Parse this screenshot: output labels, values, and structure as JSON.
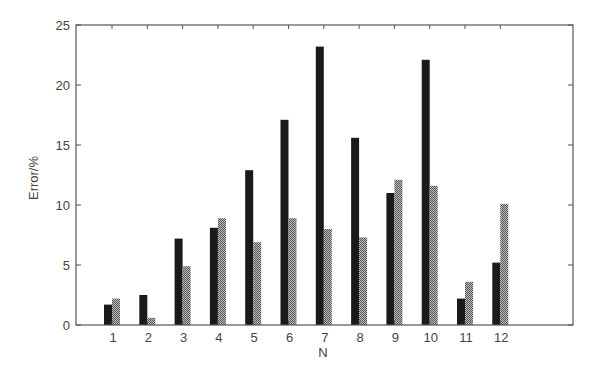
{
  "chart_data": {
    "type": "bar",
    "title": "",
    "xlabel": "N",
    "ylabel": "Error/%",
    "categories": [
      "1",
      "2",
      "3",
      "4",
      "5",
      "6",
      "7",
      "8",
      "9",
      "10",
      "11",
      "12"
    ],
    "series": [
      {
        "name": "Series 1",
        "style": "solid-dark",
        "color": "#1a1a1a",
        "values": [
          1.7,
          2.5,
          7.2,
          8.1,
          12.9,
          17.1,
          23.2,
          15.6,
          11.0,
          22.1,
          2.2,
          5.2
        ]
      },
      {
        "name": "Series 2",
        "style": "checkered-gray",
        "color": "#7a7a7a",
        "values": [
          2.2,
          0.6,
          4.9,
          8.9,
          6.9,
          8.9,
          8.0,
          7.3,
          12.1,
          11.6,
          3.6,
          10.1
        ]
      }
    ],
    "ylim": [
      0,
      25
    ],
    "yticks": [
      0,
      5,
      10,
      15,
      20,
      25
    ],
    "xlim": [
      0,
      14
    ],
    "grid": false,
    "legend": null,
    "box": true
  },
  "layout": {
    "plot_left": 76,
    "plot_right": 573,
    "plot_top": 25,
    "plot_bottom": 325,
    "group_center_first": 112,
    "group_spacing": 35.3,
    "bar_width": 8
  },
  "colors": {
    "axis": "#555555",
    "text": "#444444",
    "dark_bar": "#1a1a1a",
    "check_dark": "#555555",
    "check_light": "#bdbdbd"
  }
}
